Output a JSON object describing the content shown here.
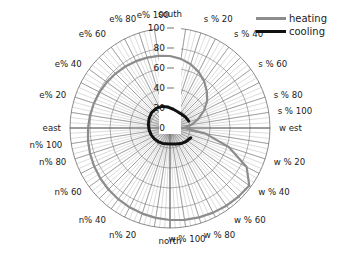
{
  "title": "",
  "legend": {
    "position": "top-right",
    "entries": [
      {
        "label": "heating",
        "color": "#8c8c8c"
      },
      {
        "label": "cooling",
        "color": "#111111"
      }
    ]
  },
  "axes": {
    "radial_ticks": [
      "0",
      "20",
      "40",
      "60",
      "80",
      "100"
    ],
    "radial_tick_values": [
      0,
      20,
      40,
      60,
      80,
      100
    ],
    "rlim": [
      0,
      100
    ],
    "grid": true
  },
  "angular_labels": [
    {
      "label": "south",
      "angle_deg": 90
    },
    {
      "label": "s % 20",
      "angle_deg": 72
    },
    {
      "label": "s % 40",
      "angle_deg": 54
    },
    {
      "label": "s % 60",
      "angle_deg": 36
    },
    {
      "label": "s % 80",
      "angle_deg": 18
    },
    {
      "label": "s % 100",
      "angle_deg": 9
    },
    {
      "label": "w est",
      "angle_deg": 0
    },
    {
      "label": "w % 20",
      "angle_deg": -18
    },
    {
      "label": "w % 40",
      "angle_deg": -36
    },
    {
      "label": "w % 60",
      "angle_deg": -54
    },
    {
      "label": "w % 80",
      "angle_deg": -72
    },
    {
      "label": "w % 100",
      "angle_deg": -81
    },
    {
      "label": "north",
      "angle_deg": -90
    },
    {
      "label": "n% 20",
      "angle_deg": -108
    },
    {
      "label": "n% 40",
      "angle_deg": -126
    },
    {
      "label": "n% 60",
      "angle_deg": -144
    },
    {
      "label": "n% 80",
      "angle_deg": -162
    },
    {
      "label": "n% 100",
      "angle_deg": -171
    },
    {
      "label": "east",
      "angle_deg": 180
    },
    {
      "label": "e% 20",
      "angle_deg": 162
    },
    {
      "label": "e% 40",
      "angle_deg": 144
    },
    {
      "label": "e% 60",
      "angle_deg": 126
    },
    {
      "label": "e% 80",
      "angle_deg": 108
    },
    {
      "label": "e% 100",
      "angle_deg": 99
    }
  ],
  "chart_data": {
    "type": "line",
    "subtype": "polar-spiral",
    "title": "",
    "rlabel": "",
    "rlim": [
      0,
      100
    ],
    "rticks": [
      0,
      20,
      40,
      60,
      80,
      100
    ],
    "grid": true,
    "theta_labels": [
      "south",
      "s % 20",
      "s % 40",
      "s % 60",
      "s % 80",
      "s % 100",
      "w est",
      "w % 20",
      "w % 40",
      "w % 60",
      "w % 80",
      "w % 100",
      "north",
      "n% 20",
      "n% 40",
      "n% 60",
      "n% 80",
      "n% 100",
      "east",
      "e% 20",
      "e% 40",
      "e% 60",
      "e% 80",
      "e% 100"
    ],
    "series": [
      {
        "name": "heating",
        "color": "#8c8c8c",
        "theta_deg": [
          0,
          9,
          18,
          27,
          36,
          45,
          54,
          63,
          72,
          81,
          90,
          99,
          108,
          117,
          126,
          135,
          144,
          153,
          162,
          171,
          180,
          189,
          198,
          207,
          216,
          225,
          234,
          243,
          252,
          261,
          270,
          279,
          288,
          297,
          306,
          315,
          324,
          333,
          342,
          351,
          358
        ],
        "r": [
          14,
          22,
          30,
          38,
          46,
          52,
          58,
          63,
          67,
          70,
          72,
          73,
          74,
          75,
          76,
          77,
          78,
          79,
          80,
          81,
          82,
          83,
          84,
          85,
          86,
          87,
          88,
          89,
          90,
          91,
          92,
          93,
          94,
          95,
          96,
          97,
          98,
          86,
          62,
          36,
          16
        ]
      },
      {
        "name": "cooling",
        "color": "#111111",
        "theta_deg": [
          20,
          35,
          50,
          65,
          80,
          95,
          110,
          125,
          140,
          155,
          170,
          185,
          200,
          215,
          230,
          245,
          260,
          275,
          290,
          305,
          320,
          335
        ],
        "r": [
          20,
          19,
          18,
          18,
          19,
          21,
          23,
          24,
          24,
          23,
          22,
          21,
          20,
          19,
          18,
          17,
          16,
          16,
          17,
          19,
          21,
          23
        ]
      }
    ]
  }
}
